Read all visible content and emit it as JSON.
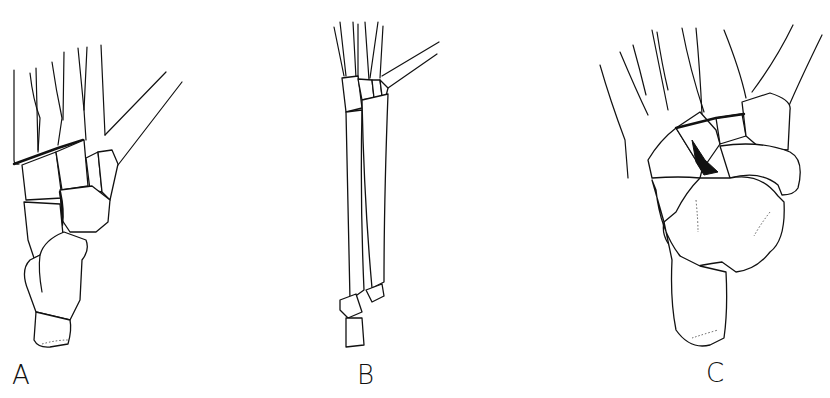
{
  "figure": {
    "panels": [
      {
        "id": "A",
        "label": "A",
        "description": "Dorsal view of foot skeleton with metatarsals and tarsal bones"
      },
      {
        "id": "B",
        "label": "B",
        "description": "Elongated foot skeleton view (lateral) with long tarsal bones"
      },
      {
        "id": "C",
        "label": "C",
        "description": "Foot skeleton with enlarged, deformed tarsal bones"
      }
    ],
    "colors": {
      "line": "#111111",
      "background": "#ffffff"
    }
  }
}
